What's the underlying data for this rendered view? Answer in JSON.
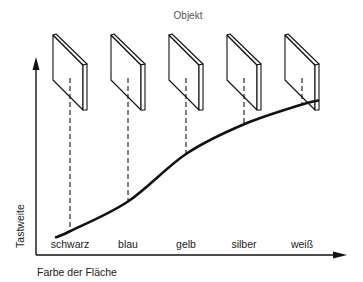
{
  "title": "Objekt",
  "y_axis_label": "Tastweite",
  "x_axis_label": "Farbe der Fläche",
  "colors": {
    "ink": "#111111",
    "background": "#ffffff"
  },
  "chart_data": {
    "type": "line",
    "title": "Objekt",
    "xlabel": "Farbe der Fläche",
    "ylabel": "Tastweite",
    "categories": [
      "schwarz",
      "blau",
      "gelb",
      "silber",
      "weiß"
    ],
    "values": [
      0.12,
      0.27,
      0.51,
      0.66,
      0.76
    ],
    "ylim": [
      0,
      1
    ],
    "grid": false,
    "curve_start": 0.09,
    "curve_end": 0.78,
    "object_icons": "plate"
  }
}
